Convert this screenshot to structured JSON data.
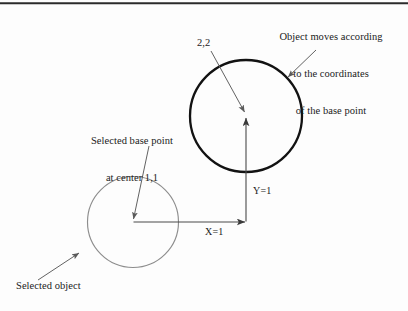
{
  "figure": {
    "title_caption": "",
    "border": {
      "top_rule_color": "#2b2b2b"
    },
    "colors": {
      "selected_object_stroke": "#8a8a8a",
      "moved_object_stroke": "#111111",
      "leader_line": "#5a5a5a",
      "axis_line": "#4a4a4a",
      "text": "#1b1b1b",
      "background": "#fdfdfd"
    },
    "annotations": {
      "object_moves": {
        "line1": "Object moves according",
        "line2": "to the coordinates",
        "line3": "of the base point"
      },
      "base_point": {
        "line1": "Selected base point",
        "line2": "at center 1,1"
      },
      "selected_object": "Selected object",
      "new_coordinate": "2,2",
      "x_offset": "X=1",
      "y_offset": "Y=1"
    },
    "shapes": {
      "selected_object_circle": {
        "name": "selected object",
        "center_x": 133,
        "center_y": 222,
        "radius": 45
      },
      "moved_object_circle": {
        "name": "moved object",
        "center_x": 246,
        "center_y": 116,
        "radius": 56
      }
    },
    "base_point": {
      "label": "base point",
      "x": 133,
      "y": 222,
      "coordinates": "1,1"
    },
    "destination_point": {
      "label": "destination point",
      "x": 246,
      "y": 116,
      "coordinates": "2,2"
    }
  }
}
